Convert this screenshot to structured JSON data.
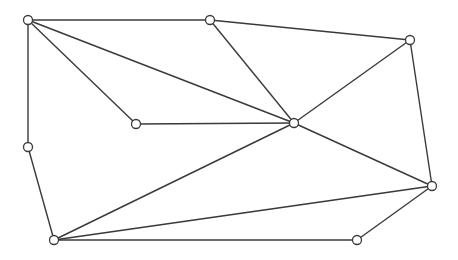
{
  "diagram": {
    "type": "undirected-graph",
    "node_radius": 4.5,
    "colors": {
      "background": "#ffffff",
      "edge": "#3a3a3a",
      "node_fill": "#ffffff",
      "node_stroke": "#3a3a3a"
    },
    "nodes": [
      {
        "id": "A",
        "x": 28,
        "y": 20
      },
      {
        "id": "B",
        "x": 210,
        "y": 20
      },
      {
        "id": "C",
        "x": 410,
        "y": 40
      },
      {
        "id": "D",
        "x": 136,
        "y": 124
      },
      {
        "id": "E",
        "x": 294,
        "y": 123
      },
      {
        "id": "F",
        "x": 28,
        "y": 147
      },
      {
        "id": "G",
        "x": 432,
        "y": 186
      },
      {
        "id": "H",
        "x": 54,
        "y": 240
      },
      {
        "id": "I",
        "x": 357,
        "y": 240
      }
    ],
    "edges": [
      [
        "A",
        "B"
      ],
      [
        "A",
        "D"
      ],
      [
        "A",
        "E"
      ],
      [
        "A",
        "F"
      ],
      [
        "B",
        "C"
      ],
      [
        "B",
        "E"
      ],
      [
        "C",
        "E"
      ],
      [
        "C",
        "G"
      ],
      [
        "D",
        "E"
      ],
      [
        "E",
        "G"
      ],
      [
        "E",
        "H"
      ],
      [
        "F",
        "H"
      ],
      [
        "G",
        "H"
      ],
      [
        "G",
        "I"
      ],
      [
        "H",
        "I"
      ]
    ]
  }
}
